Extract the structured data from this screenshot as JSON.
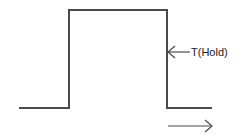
{
  "diagram": {
    "type": "pulse-waveform",
    "stroke_color": "#4a4a4a",
    "waveform_points": [
      [
        19,
        108
      ],
      [
        69,
        108
      ],
      [
        69,
        10
      ],
      [
        167,
        10
      ],
      [
        167,
        108
      ],
      [
        212,
        108
      ]
    ],
    "annotation": {
      "label": "T(Hold)",
      "points_to": "falling edge",
      "arrow_from": [
        190,
        52
      ],
      "arrow_to": [
        168,
        52
      ]
    },
    "direction_arrow": {
      "from": [
        168,
        126
      ],
      "to": [
        212,
        126
      ],
      "meaning": "time direction"
    }
  }
}
